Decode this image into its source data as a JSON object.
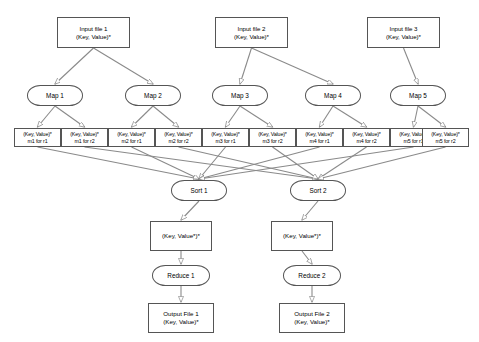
{
  "diagram": {
    "style": {
      "node_stroke": "#555555",
      "edge_stroke": "#888888",
      "background": "#ffffff",
      "text": "#000000"
    }
  },
  "inputs": [
    {
      "id": "in1",
      "label": "Input file 1",
      "sublabel": "(Key, Value)*",
      "x": 57,
      "y": 17,
      "w": 73,
      "h": 31
    },
    {
      "id": "in2",
      "label": "Input file 2",
      "sublabel": "(Key, Value)*",
      "x": 215,
      "y": 17,
      "w": 73,
      "h": 31
    },
    {
      "id": "in3",
      "label": "Input file 3",
      "sublabel": "(Key, Value)*",
      "x": 367,
      "y": 17,
      "w": 73,
      "h": 31
    }
  ],
  "maps": [
    {
      "id": "m1",
      "label": "Map 1",
      "x": 27,
      "y": 85,
      "w": 56,
      "h": 21
    },
    {
      "id": "m2",
      "label": "Map 2",
      "x": 125,
      "y": 85,
      "w": 56,
      "h": 21
    },
    {
      "id": "m3",
      "label": "Map 3",
      "x": 212,
      "y": 85,
      "w": 56,
      "h": 21
    },
    {
      "id": "m4",
      "label": "Map 4",
      "x": 305,
      "y": 85,
      "w": 56,
      "h": 21
    },
    {
      "id": "m5",
      "label": "Map 5",
      "x": 390,
      "y": 85,
      "w": 56,
      "h": 21
    }
  ],
  "partitions": [
    {
      "id": "p1",
      "kv": "(Key, Value)*",
      "label": "m1 for r1",
      "x": 14,
      "y": 128,
      "w": 47,
      "h": 19
    },
    {
      "id": "p2",
      "kv": "(Key, Value)*",
      "label": "m1 for r2",
      "x": 61,
      "y": 128,
      "w": 47,
      "h": 19
    },
    {
      "id": "p3",
      "kv": "(Key, Value)*",
      "label": "m2 for r1",
      "x": 108,
      "y": 128,
      "w": 47,
      "h": 19
    },
    {
      "id": "p4",
      "kv": "(Key, Value)*",
      "label": "m2 for r2",
      "x": 155,
      "y": 128,
      "w": 47,
      "h": 19
    },
    {
      "id": "p5",
      "kv": "(Key, Value)*",
      "label": "m3 for r1",
      "x": 202,
      "y": 128,
      "w": 47,
      "h": 19
    },
    {
      "id": "p6",
      "kv": "(Key, Value)*",
      "label": "m3 for r2",
      "x": 249,
      "y": 128,
      "w": 47,
      "h": 19
    },
    {
      "id": "p7",
      "kv": "(Key, Value)*",
      "label": "m4 for r1",
      "x": 296,
      "y": 128,
      "w": 47,
      "h": 19
    },
    {
      "id": "p8",
      "kv": "(Key, Value)*",
      "label": "m4 for r2",
      "x": 343,
      "y": 128,
      "w": 47,
      "h": 19
    },
    {
      "id": "p9",
      "kv": "(Key, Value)*",
      "label": "m5 for r1",
      "x": 390,
      "y": 128,
      "w": 47,
      "h": 19
    },
    {
      "id": "p10",
      "kv": "(Key, Value)*",
      "label": "m5 for r2",
      "x": 422,
      "y": 128,
      "w": 47,
      "h": 19
    }
  ],
  "sorts": [
    {
      "id": "s1",
      "label": "Sort 1",
      "x": 171,
      "y": 180,
      "w": 56,
      "h": 21
    },
    {
      "id": "s2",
      "label": "Sort 2",
      "x": 290,
      "y": 180,
      "w": 56,
      "h": 21
    }
  ],
  "sorted": [
    {
      "id": "k1",
      "label": "(Key, Value*)*",
      "x": 150,
      "y": 221,
      "w": 62,
      "h": 30
    },
    {
      "id": "k2",
      "label": "(Key, Value*)*",
      "x": 271,
      "y": 221,
      "w": 62,
      "h": 30
    }
  ],
  "reduces": [
    {
      "id": "r1",
      "label": "Reduce 1",
      "x": 152,
      "y": 265,
      "w": 58,
      "h": 21
    },
    {
      "id": "r2",
      "label": "Reduce 2",
      "x": 283,
      "y": 265,
      "w": 58,
      "h": 21
    }
  ],
  "outputs": [
    {
      "id": "o1",
      "label": "Output File 1",
      "sublabel": "(Key, Value)*",
      "x": 148,
      "y": 303,
      "w": 66,
      "h": 30
    },
    {
      "id": "o2",
      "label": "Output File 2",
      "sublabel": "(Key, Value)*",
      "x": 279,
      "y": 303,
      "w": 66,
      "h": 30
    }
  ],
  "edges": [
    {
      "from": "in1",
      "to": "m1"
    },
    {
      "from": "in1",
      "to": "m2"
    },
    {
      "from": "in2",
      "to": "m3"
    },
    {
      "from": "in2",
      "to": "m4"
    },
    {
      "from": "in3",
      "to": "m5"
    },
    {
      "from": "m1",
      "to": "p1"
    },
    {
      "from": "m1",
      "to": "p2"
    },
    {
      "from": "m2",
      "to": "p3"
    },
    {
      "from": "m2",
      "to": "p4"
    },
    {
      "from": "m3",
      "to": "p5"
    },
    {
      "from": "m3",
      "to": "p6"
    },
    {
      "from": "m4",
      "to": "p7"
    },
    {
      "from": "m4",
      "to": "p8"
    },
    {
      "from": "m5",
      "to": "p9"
    },
    {
      "from": "m5",
      "to": "p10"
    },
    {
      "from": "p1",
      "to": "s1"
    },
    {
      "from": "p3",
      "to": "s1"
    },
    {
      "from": "p5",
      "to": "s1"
    },
    {
      "from": "p7",
      "to": "s1"
    },
    {
      "from": "p9",
      "to": "s1"
    },
    {
      "from": "p2",
      "to": "s2"
    },
    {
      "from": "p4",
      "to": "s2"
    },
    {
      "from": "p6",
      "to": "s2"
    },
    {
      "from": "p8",
      "to": "s2"
    },
    {
      "from": "p10",
      "to": "s2"
    },
    {
      "from": "s1",
      "to": "k1"
    },
    {
      "from": "s2",
      "to": "k2"
    },
    {
      "from": "k1",
      "to": "r1"
    },
    {
      "from": "k2",
      "to": "r2"
    },
    {
      "from": "r1",
      "to": "o1"
    },
    {
      "from": "r2",
      "to": "o2"
    }
  ]
}
